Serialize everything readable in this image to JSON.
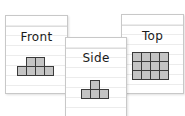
{
  "diagram": {
    "cards": [
      {
        "id": "front",
        "label": "Front",
        "shape": {
          "rows": [
            [
              0,
              1,
              1,
              0
            ],
            [
              1,
              1,
              1,
              1
            ]
          ]
        }
      },
      {
        "id": "side",
        "label": "Side",
        "shape": {
          "rows": [
            [
              0,
              1,
              0
            ],
            [
              1,
              1,
              1
            ]
          ]
        }
      },
      {
        "id": "top",
        "label": "Top",
        "shape": {
          "rows": [
            [
              1,
              1,
              1,
              1
            ],
            [
              1,
              1,
              1,
              1
            ],
            [
              1,
              1,
              1,
              1
            ]
          ]
        }
      }
    ],
    "colors": {
      "cell_fill": "#c4c4c4",
      "cell_border": "#3a3a3a",
      "card_border": "#c8c8c8",
      "rule_line": "#ececec"
    }
  }
}
